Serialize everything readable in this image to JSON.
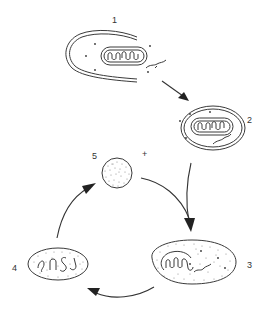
{
  "diagram": {
    "type": "cycle",
    "colors": {
      "stroke": "#3a3a3a",
      "arrow": "#222222",
      "background": "#ffffff"
    },
    "stages": [
      {
        "id": 1,
        "label": "1",
        "content": "open double-membrane cup enclosing a mitochondrion, dots and a small fibre"
      },
      {
        "id": 2,
        "label": "2",
        "content": "closed double-membrane oval enclosing a mitochondrion, dots and a small fibre"
      },
      {
        "id": 3,
        "label": "3",
        "content": "stippled oval with a coiled mitochondrion-like remnant and wavy fibre"
      },
      {
        "id": 4,
        "label": "4",
        "content": "stippled oval containing several curled fragments"
      },
      {
        "id": 5,
        "label": "5",
        "content": "small stippled sphere"
      }
    ],
    "plus_sign": "+",
    "arrows": [
      {
        "from": 1,
        "to": 2
      },
      {
        "from": 2,
        "to": 3
      },
      {
        "from": 5,
        "to": 3
      },
      {
        "from": 3,
        "to": 4
      },
      {
        "from": 4,
        "to": 5
      }
    ]
  }
}
